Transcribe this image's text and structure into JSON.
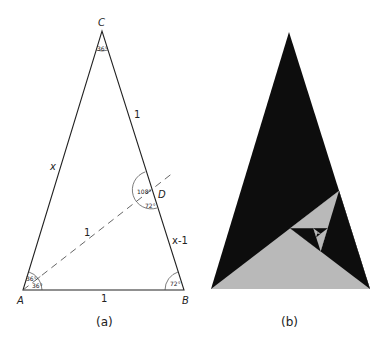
{
  "figure_a": {
    "caption": "(a)",
    "vertices": {
      "A": {
        "label": "A",
        "x": 23,
        "y": 290
      },
      "B": {
        "label": "B",
        "x": 184,
        "y": 290
      },
      "C": {
        "label": "C",
        "x": 102,
        "y": 31
      },
      "D": {
        "label": "D",
        "x": 151,
        "y": 190
      }
    },
    "side_labels": {
      "AC": "x",
      "CD": "1",
      "DB": "x-1",
      "AB": "1",
      "AD": "1"
    },
    "angle_labels": {
      "C": "36°",
      "A_upper": "36°",
      "A_lower": "36°",
      "B": "72°",
      "D_left": "108°",
      "D_right": "72°"
    },
    "line_color": "#222222"
  },
  "figure_b": {
    "caption": "(b)",
    "vertices": {
      "C": {
        "x": 289,
        "y": 32
      },
      "A": {
        "x": 211,
        "y": 289
      },
      "B": {
        "x": 370,
        "y": 289
      }
    },
    "colors": {
      "dark": "#0d0d0d",
      "light": "#b9b9b9"
    },
    "recursion_depth": 9
  }
}
